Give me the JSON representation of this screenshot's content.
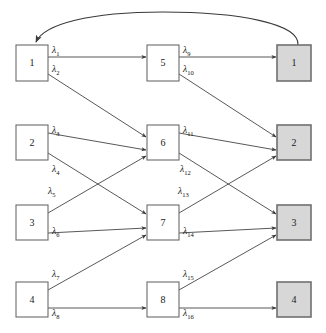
{
  "diagram": {
    "colors": {
      "output_node_fill": "#d7d7d7",
      "node_fill": "#ffffff",
      "node_stroke": "#6b6b6b",
      "output_node_stroke": "#707070",
      "edge_stroke": "#3a3a3a",
      "background": "#ffffff"
    },
    "layers": [
      {
        "name": "input-layer",
        "nodes": [
          {
            "label": "1",
            "x": 16,
            "y": 45,
            "w": 32,
            "h": 36
          },
          {
            "label": "2",
            "x": 16,
            "y": 125,
            "w": 32,
            "h": 35
          },
          {
            "label": "3",
            "x": 16,
            "y": 205,
            "w": 32,
            "h": 35
          },
          {
            "label": "4",
            "x": 16,
            "y": 282,
            "w": 32,
            "h": 35
          }
        ]
      },
      {
        "name": "hidden-layer",
        "nodes": [
          {
            "label": "5",
            "x": 147,
            "y": 45,
            "w": 32,
            "h": 36
          },
          {
            "label": "6",
            "x": 147,
            "y": 125,
            "w": 32,
            "h": 35
          },
          {
            "label": "7",
            "x": 147,
            "y": 205,
            "w": 32,
            "h": 35
          },
          {
            "label": "8",
            "x": 147,
            "y": 282,
            "w": 32,
            "h": 35
          }
        ]
      },
      {
        "name": "output-layer",
        "nodes": [
          {
            "label": "1",
            "x": 277,
            "y": 45,
            "w": 34,
            "h": 36
          },
          {
            "label": "2",
            "x": 277,
            "y": 125,
            "w": 34,
            "h": 35
          },
          {
            "label": "3",
            "x": 277,
            "y": 205,
            "w": 34,
            "h": 35
          },
          {
            "label": "4",
            "x": 277,
            "y": 282,
            "w": 34,
            "h": 35
          }
        ]
      }
    ],
    "edges": [
      {
        "id": "e1",
        "from": "input-1",
        "to": "hidden-5",
        "x1": 48,
        "y1": 57,
        "x2": 146,
        "y2": 57,
        "label": "λ",
        "sub": "1",
        "lx": 52,
        "ly": 53
      },
      {
        "id": "e2",
        "from": "input-1",
        "to": "hidden-6",
        "x1": 48,
        "y1": 74,
        "x2": 146,
        "y2": 137,
        "label": "λ",
        "sub": "2",
        "lx": 52,
        "ly": 72
      },
      {
        "id": "e3",
        "from": "input-2",
        "to": "hidden-6",
        "x1": 48,
        "y1": 133,
        "x2": 146,
        "y2": 150,
        "label": "λ",
        "sub": "3",
        "lx": 52,
        "ly": 133
      },
      {
        "id": "e4",
        "from": "input-2",
        "to": "hidden-7",
        "x1": 48,
        "y1": 153,
        "x2": 146,
        "y2": 214,
        "label": "λ",
        "sub": "4",
        "lx": 52,
        "ly": 172
      },
      {
        "id": "e5",
        "from": "input-3",
        "to": "hidden-6",
        "x1": 48,
        "y1": 213,
        "x2": 146,
        "y2": 156,
        "label": "λ",
        "sub": "5",
        "lx": 48,
        "ly": 194
      },
      {
        "id": "e6",
        "from": "input-3",
        "to": "hidden-7",
        "x1": 48,
        "y1": 233,
        "x2": 146,
        "y2": 228,
        "label": "λ",
        "sub": "6",
        "lx": 52,
        "ly": 234
      },
      {
        "id": "e7",
        "from": "input-4",
        "to": "hidden-7",
        "x1": 48,
        "y1": 290,
        "x2": 146,
        "y2": 235,
        "label": "λ",
        "sub": "7",
        "lx": 52,
        "ly": 277
      },
      {
        "id": "e8",
        "from": "input-4",
        "to": "hidden-8",
        "x1": 48,
        "y1": 308,
        "x2": 146,
        "y2": 308,
        "label": "λ",
        "sub": "8",
        "lx": 52,
        "ly": 316
      },
      {
        "id": "e9",
        "from": "hidden-5",
        "to": "output-1",
        "x1": 179,
        "y1": 57,
        "x2": 276,
        "y2": 57,
        "label": "λ",
        "sub": "9",
        "lx": 183,
        "ly": 53
      },
      {
        "id": "e10",
        "from": "hidden-5",
        "to": "output-2",
        "x1": 179,
        "y1": 74,
        "x2": 276,
        "y2": 137,
        "label": "λ",
        "sub": "10",
        "lx": 183,
        "ly": 72
      },
      {
        "id": "e11",
        "from": "hidden-6",
        "to": "output-2",
        "x1": 179,
        "y1": 133,
        "x2": 276,
        "y2": 150,
        "label": "λ",
        "sub": "11",
        "lx": 183,
        "ly": 133
      },
      {
        "id": "e12",
        "from": "hidden-6",
        "to": "output-3",
        "x1": 179,
        "y1": 153,
        "x2": 276,
        "y2": 214,
        "label": "λ",
        "sub": "12",
        "lx": 180,
        "ly": 172
      },
      {
        "id": "e13",
        "from": "hidden-7",
        "to": "output-2",
        "x1": 179,
        "y1": 213,
        "x2": 276,
        "y2": 156,
        "label": "λ",
        "sub": "13",
        "lx": 178,
        "ly": 194
      },
      {
        "id": "e14",
        "from": "hidden-7",
        "to": "output-3",
        "x1": 179,
        "y1": 233,
        "x2": 276,
        "y2": 228,
        "label": "λ",
        "sub": "14",
        "lx": 183,
        "ly": 234
      },
      {
        "id": "e15",
        "from": "hidden-8",
        "to": "output-3",
        "x1": 179,
        "y1": 290,
        "x2": 276,
        "y2": 235,
        "label": "λ",
        "sub": "15",
        "lx": 183,
        "ly": 277
      },
      {
        "id": "e16",
        "from": "hidden-8",
        "to": "output-4",
        "x1": 179,
        "y1": 308,
        "x2": 276,
        "y2": 308,
        "label": "λ",
        "sub": "16",
        "lx": 183,
        "ly": 316
      }
    ],
    "feedback": {
      "name": "feedback-arrow",
      "from": "output-1",
      "to": "input-1",
      "path": "M 298 45 C 300 24 240 12 163 12 C 90 12 44 24 36 42"
    }
  }
}
